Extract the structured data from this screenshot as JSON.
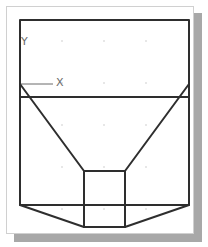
{
  "drawing": {
    "stroke_color": "#2e2e2e",
    "frame_border_color": "#d0d0d0",
    "shadow_color": "#a8a8a8",
    "grid_dot_color": "#c8c8c8",
    "ucs_icon": {
      "x_label": "X",
      "y_label": "Y",
      "color": "#6a6a6a"
    },
    "shapes": [
      {
        "name": "outer-rectangle",
        "type": "rect",
        "x": 20,
        "y": 20,
        "width": 169,
        "height": 185
      },
      {
        "name": "horizontal-line",
        "type": "line",
        "x1": 20,
        "y1": 97,
        "x2": 189,
        "y2": 97
      },
      {
        "name": "left-diagonal",
        "type": "line",
        "x1": 20,
        "y1": 84,
        "x2": 84,
        "y2": 171
      },
      {
        "name": "right-diagonal",
        "type": "line",
        "x1": 189,
        "y1": 84,
        "x2": 125,
        "y2": 171
      },
      {
        "name": "inner-rectangle",
        "type": "rect",
        "x": 84,
        "y": 171,
        "width": 41,
        "height": 56
      },
      {
        "name": "bottom-left-slant",
        "type": "line",
        "x1": 20,
        "y1": 205,
        "x2": 84,
        "y2": 227
      },
      {
        "name": "bottom-right-slant",
        "type": "line",
        "x1": 189,
        "y1": 205,
        "x2": 125,
        "y2": 227
      }
    ]
  }
}
